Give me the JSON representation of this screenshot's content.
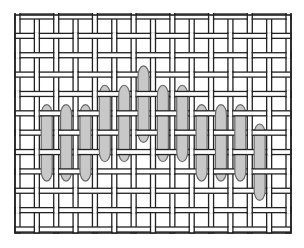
{
  "diagram": {
    "mesh": {
      "vertical_strands": 15,
      "horizontal_strands": 12,
      "strand_fill": "#ffffff",
      "strand_outline": "#222222"
    },
    "elements": {
      "count": 12,
      "fill": "#c8c8c8",
      "outline": "#6a6a6a",
      "items": [
        {
          "column": 2,
          "row_start": 5.0
        },
        {
          "column": 3,
          "row_start": 5.0
        },
        {
          "column": 4,
          "row_start": 5.0
        },
        {
          "column": 5,
          "row_start": 4.0
        },
        {
          "column": 6,
          "row_start": 4.0
        },
        {
          "column": 7,
          "row_start": 3.0
        },
        {
          "column": 8,
          "row_start": 4.0
        },
        {
          "column": 9,
          "row_start": 4.0
        },
        {
          "column": 10,
          "row_start": 5.0
        },
        {
          "column": 11,
          "row_start": 5.0
        },
        {
          "column": 12,
          "row_start": 5.0
        },
        {
          "column": 13,
          "row_start": 6.0
        }
      ]
    }
  }
}
